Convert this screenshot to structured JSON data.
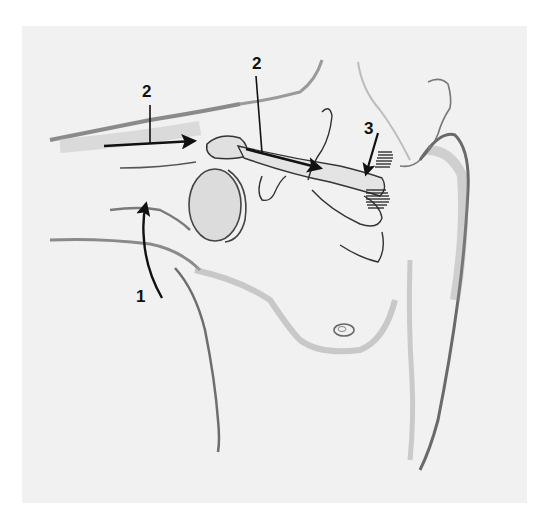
{
  "figure": {
    "type": "anatomical-illustration",
    "background_color": "#f1f1f1",
    "ink_color": "#111111",
    "labels": [
      {
        "id": "label-1",
        "text": "1",
        "x": 138,
        "y": 288,
        "arrow": "curved upward toward axilla / humeral head"
      },
      {
        "id": "label-2a",
        "text": "2",
        "x": 142,
        "y": 83,
        "arrow": "horizontal rightward toward acromioclavicular region"
      },
      {
        "id": "label-2b",
        "text": "2",
        "x": 254,
        "y": 55,
        "arrow": "along clavicle toward sternum"
      },
      {
        "id": "label-3",
        "text": "3",
        "x": 366,
        "y": 120,
        "arrow": "downward toward sternoclavicular joint"
      }
    ]
  }
}
